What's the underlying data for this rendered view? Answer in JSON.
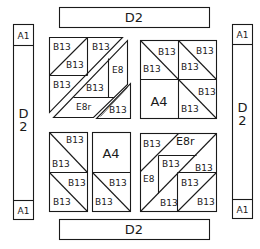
{
  "diagram": {
    "type": "quilt-block-layout",
    "borders": {
      "top": {
        "label": "D2"
      },
      "bottom": {
        "label": "D2"
      },
      "left": {
        "top_corner": "A1",
        "label_line1": "D",
        "label_line2": "2",
        "bottom_corner": "A1"
      },
      "right": {
        "top_corner": "A1",
        "label_line1": "D",
        "label_line2": "2",
        "bottom_corner": "A1"
      }
    },
    "blocks": {
      "top_left": {
        "pieces": [
          "B13",
          "B13",
          "B13",
          "B13",
          "E8",
          "B13",
          "E8r",
          "B13"
        ]
      },
      "top_right": {
        "pieces": [
          "B13",
          "B13",
          "B13",
          "B13",
          "A4",
          "B13",
          "B13"
        ]
      },
      "bottom_left": {
        "pieces": [
          "B13",
          "B13",
          "A4",
          "B13",
          "B13",
          "B13",
          "B13"
        ]
      },
      "bottom_right": {
        "pieces": [
          "B13",
          "E8r",
          "B13",
          "B13",
          "E8",
          "B13",
          "B13",
          "B13"
        ]
      }
    }
  }
}
